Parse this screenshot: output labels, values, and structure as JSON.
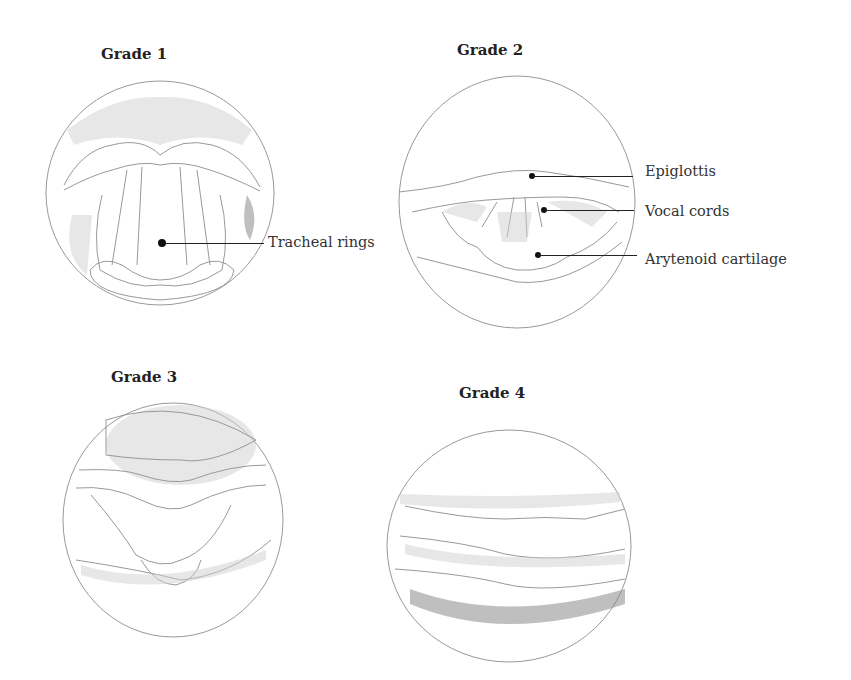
{
  "figure": {
    "panels": [
      {
        "title": "Grade 1",
        "labels": [
          "Tracheal rings"
        ]
      },
      {
        "title": "Grade 2",
        "labels": [
          "Epiglottis",
          "Vocal cords",
          "Arytenoid cartilage"
        ]
      },
      {
        "title": "Grade 3",
        "labels": []
      },
      {
        "title": "Grade 4",
        "labels": []
      }
    ]
  }
}
